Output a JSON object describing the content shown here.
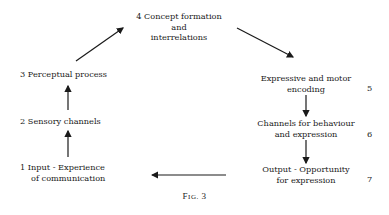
{
  "diagram": {
    "nodes": [
      {
        "id": 1,
        "text_line1": "1 Input - Experience",
        "text_line2": "of communication"
      },
      {
        "id": 2,
        "text": "2 Sensory channels"
      },
      {
        "id": 3,
        "text": "3 Perceptual process"
      },
      {
        "id": 4,
        "text_line1": "4 Concept formation",
        "text_line2": "and",
        "text_line3": "interrelations"
      },
      {
        "id": 5,
        "text_line1": "Expressive and motor",
        "text_line2": "encoding",
        "number": "5"
      },
      {
        "id": 6,
        "text_line1": "Channels for behaviour",
        "text_line2": "and expression",
        "number": "6"
      },
      {
        "id": 7,
        "text_line1": "Output - Opportunity",
        "text_line2": "for expression",
        "number": "7"
      }
    ],
    "edges": [
      {
        "from": 1,
        "to": 2
      },
      {
        "from": 2,
        "to": 3
      },
      {
        "from": 3,
        "to": 4
      },
      {
        "from": 4,
        "to": 5
      },
      {
        "from": 5,
        "to": 6
      },
      {
        "from": 6,
        "to": 7
      },
      {
        "from": 7,
        "to": 1
      }
    ],
    "caption_prefix": "F",
    "caption_smallcaps": "IG.",
    "caption_number": "3"
  }
}
